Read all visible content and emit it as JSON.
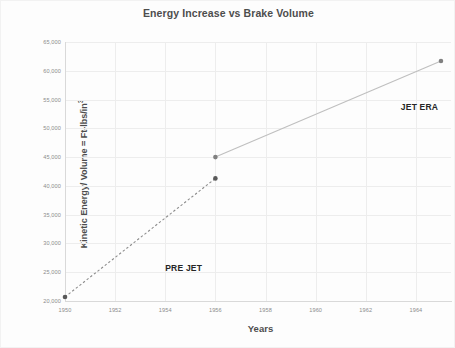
{
  "chart_data": {
    "type": "line",
    "title": "Energy Increase vs Brake Volume",
    "xlabel": "Years",
    "ylabel": "Kinetic Energy/ Volume = Ft-lbs/in",
    "ylabel_exponent": "3",
    "xlim": [
      1950,
      1965.4
    ],
    "ylim": [
      20000,
      65000
    ],
    "xticks": [
      1950,
      1952,
      1954,
      1956,
      1958,
      1960,
      1962,
      1964
    ],
    "xtick_labels": [
      "1950",
      "1952",
      "1954",
      "1956",
      "1958",
      "1960",
      "1962",
      "1964"
    ],
    "yticks": [
      20000,
      25000,
      30000,
      35000,
      40000,
      45000,
      50000,
      55000,
      60000,
      65000
    ],
    "ytick_labels": [
      "20,000",
      "25,000",
      "30,000",
      "35,000",
      "40,000",
      "45,000",
      "50,000",
      "55,000",
      "60,000",
      "65,000"
    ],
    "grid": true,
    "legend": "none",
    "series": [
      {
        "name": "PRE JET",
        "style": "dashed",
        "color": "#8c8c8c",
        "marker_color": "#595959",
        "points": [
          {
            "x": 1950,
            "y": 20700
          },
          {
            "x": 1956,
            "y": 41300
          }
        ]
      },
      {
        "name": "JET ERA",
        "style": "solid",
        "color": "#bfbfbf",
        "marker_color": "#808080",
        "points": [
          {
            "x": 1956,
            "y": 45000
          },
          {
            "x": 1965,
            "y": 61700
          }
        ]
      }
    ],
    "annotations": [
      {
        "text": "PRE JET",
        "x": 1954.0,
        "y": 26600
      },
      {
        "text": "JET ERA",
        "x": 1963.4,
        "y": 54600
      }
    ]
  }
}
